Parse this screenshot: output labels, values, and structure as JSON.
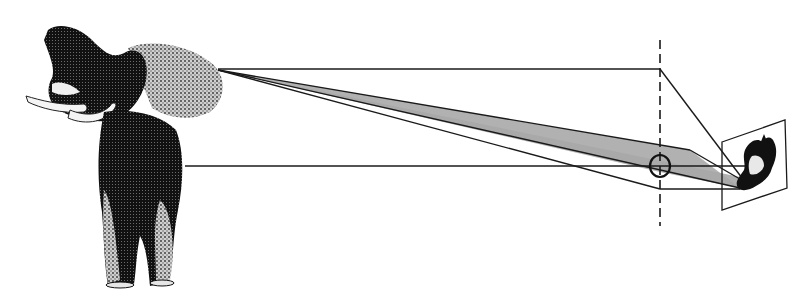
{
  "diagram": {
    "title": "",
    "colors": {
      "background": "#ffffff",
      "line": "#1a1a1a",
      "cone_fill": "#a8a8a8",
      "elephant_dark": "#111111",
      "elephant_mid": "#6a6a6a",
      "elephant_light": "#cfcfcf"
    },
    "elements": {
      "object": "elephant",
      "lens": "circle-lens",
      "optical_plane": "dashed-vertical-line",
      "image_plane": "tilted-rectangle",
      "projected_image": "inverted-elephant"
    },
    "labels": []
  }
}
